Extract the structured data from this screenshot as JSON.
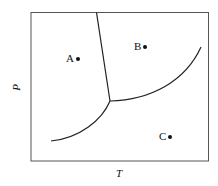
{
  "diagram": {
    "type": "phase-diagram",
    "axes": {
      "x_label": "T",
      "y_label": "P"
    },
    "points": [
      {
        "label": "A",
        "x": 71,
        "y": 58
      },
      {
        "label": "B",
        "x": 140,
        "y": 46
      },
      {
        "label": "C",
        "x": 165,
        "y": 137
      }
    ],
    "colors": {
      "line": "#222222",
      "frame": "#555555"
    }
  }
}
